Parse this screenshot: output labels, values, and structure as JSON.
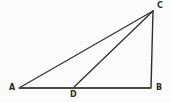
{
  "figure": {
    "width": 171,
    "height": 102,
    "background_color": "#fdfdfd",
    "stroke_color": "#2f2f2f",
    "base_stroke_color": "#555555",
    "points": {
      "A": {
        "label": "A",
        "x": 19,
        "y": 88
      },
      "B": {
        "label": "B",
        "x": 151,
        "y": 88
      },
      "C": {
        "label": "C",
        "x": 153,
        "y": 11
      },
      "D": {
        "label": "D",
        "x": 73,
        "y": 88
      }
    },
    "segments": [
      {
        "name": "AC",
        "from": "A",
        "to": "C",
        "width": 1.2,
        "color": "#2f2f2f"
      },
      {
        "name": "AB",
        "from": "A",
        "to": "B",
        "width": 2.0,
        "color": "#4a4a4a"
      },
      {
        "name": "CB",
        "from": "C",
        "to": "B",
        "width": 1.4,
        "color": "#2f2f2f"
      },
      {
        "name": "DC",
        "from": "D",
        "to": "C",
        "width": 1.3,
        "color": "#2f2f2f"
      }
    ]
  }
}
